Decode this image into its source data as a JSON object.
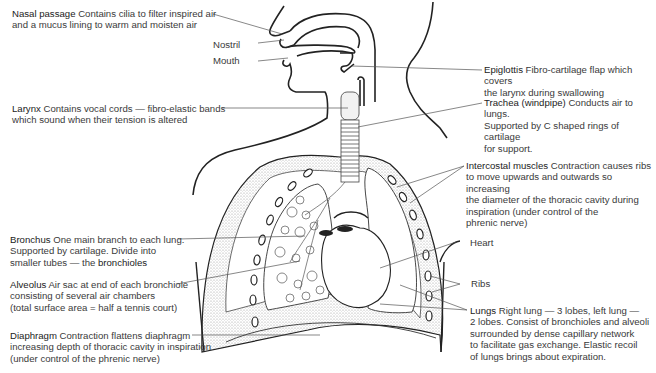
{
  "figure": {
    "colors": {
      "line": "#222222",
      "leader": "#555555",
      "stipple": "#b8b8b8",
      "text": "#3a3a3a"
    }
  },
  "labels": {
    "nasal_passage": {
      "term": "Nasal passage",
      "desc": [
        " Contains cilia to filter inspired air",
        "and a mucus lining to warm and moisten air"
      ]
    },
    "nostril": {
      "term": "Nostril"
    },
    "mouth": {
      "term": "Mouth"
    },
    "epiglottis": {
      "term": "Epiglottis",
      "desc": [
        " Fibro-cartilage flap which covers",
        "the larynx during swallowing"
      ]
    },
    "larynx": {
      "term": "Larynx",
      "desc": [
        " Contains vocal cords — fibro-elastic bands",
        "which sound when their tension is altered"
      ]
    },
    "trachea": {
      "term": "Trachea (windpipe)",
      "desc": [
        " Conducts air to lungs.",
        "Supported by C shaped rings of cartilage",
        "for support."
      ]
    },
    "intercostal": {
      "term": "Intercostal muscles",
      "desc": [
        " Contraction causes ribs",
        "to move upwards and outwards so increasing",
        "the diameter of the thoracic cavity during",
        "inspiration (under control of the",
        "phrenic nerve)"
      ]
    },
    "bronchus": {
      "term": "Bronchus",
      "desc": [
        " One main branch to each lung.",
        "Supported by cartilage. Divide into",
        "smaller tubes — the "
      ],
      "term2": "bronchioles"
    },
    "heart": {
      "term": "Heart"
    },
    "alveolus": {
      "term": "Alveolus",
      "desc": [
        " Air sac at end of each bronchiole",
        "consisting of several air chambers",
        "(total surface area = half a tennis court)"
      ]
    },
    "ribs": {
      "term": "Ribs"
    },
    "lungs": {
      "term": "Lungs",
      "desc": [
        " Right lung — 3 lobes, left lung —",
        "2 lobes. Consist of bronchioles and alveoli",
        "surrounded by dense capillary network",
        "to facilitate gas exchange. Elastic recoil",
        "of lungs brings about expiration."
      ]
    },
    "diaphragm": {
      "term": "Diaphragm",
      "desc": [
        " Contraction flattens diaphragm",
        "increasing depth of thoracic cavity in inspiration",
        "(under control of the phrenic nerve)"
      ]
    }
  }
}
